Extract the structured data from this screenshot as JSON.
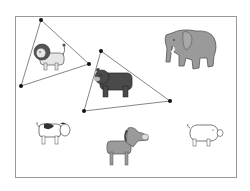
{
  "game": {
    "type": "shape-selection puzzle",
    "header_text": "",
    "animals": [
      {
        "name": "lion",
        "selected": true
      },
      {
        "name": "bear",
        "selected": true
      },
      {
        "name": "elephant",
        "selected": false
      },
      {
        "name": "cow",
        "selected": false
      },
      {
        "name": "horse",
        "selected": false
      },
      {
        "name": "pig",
        "selected": false
      }
    ],
    "selections": [
      {
        "label": "lion-triangle",
        "target": "lion"
      },
      {
        "label": "bear-triangle",
        "target": "bear"
      }
    ],
    "colors": {
      "frame": "#999999",
      "line": "#666666",
      "vertex": "#111111",
      "gray_animal": "#9a9a9a",
      "dark_animal": "#4a4a4a"
    }
  }
}
